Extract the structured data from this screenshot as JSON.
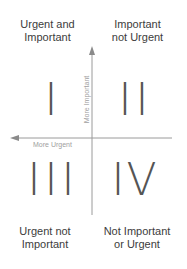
{
  "quadrants": [
    {
      "numeral": "I",
      "label_line1": "Urgent and",
      "label_line2": "Important"
    },
    {
      "numeral": "II",
      "label_line1": "Important",
      "label_line2": "not Urgent"
    },
    {
      "numeral": "III",
      "label_line1": "Urgent not",
      "label_line2": "Important"
    },
    {
      "numeral": "IV",
      "label_line1": "Not Important",
      "label_line2": "or Urgent"
    }
  ],
  "axes": {
    "vertical_label": "More Important",
    "horizontal_label": "More Urgent"
  },
  "colors": {
    "axis_line": "#9a9a9a",
    "numeral": "#555555",
    "label": "#3c3c3c",
    "axis_text": "#a0a0a0"
  }
}
